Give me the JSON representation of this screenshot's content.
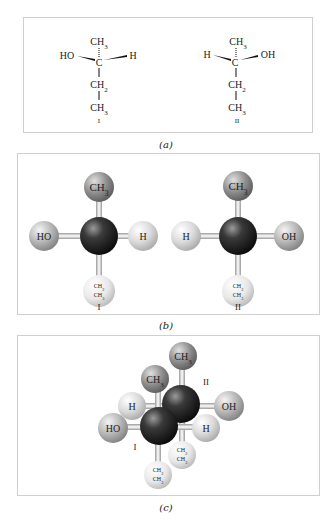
{
  "figure": {
    "panels": [
      {
        "id": "a",
        "caption": "(a)",
        "type": "wedge-dash structural formulas",
        "molecules": [
          {
            "label": "I",
            "top": "CH3",
            "center": "C",
            "left": "HO",
            "right": "H",
            "chain": [
              "CH2",
              "CH3"
            ]
          },
          {
            "label": "II",
            "top": "CH3",
            "center": "C",
            "left": "H",
            "right": "OH",
            "chain": [
              "CH2",
              "CH3"
            ]
          }
        ]
      },
      {
        "id": "b",
        "caption": "(b)",
        "type": "ball-and-stick models",
        "molecules": [
          {
            "label": "I",
            "top": "CH3",
            "left": "HO",
            "right": "H",
            "bottom_line1": "CH2",
            "bottom_line2": "CH3"
          },
          {
            "label": "II",
            "top": "CH3",
            "left": "H",
            "right": "OH",
            "bottom_line1": "CH2",
            "bottom_line2": "CH3"
          }
        ]
      },
      {
        "id": "c",
        "caption": "(c)",
        "type": "superimposed ball-and-stick models",
        "labels": {
          "molecule_I": "I",
          "molecule_II": "II",
          "back_top": "CH3",
          "front_top": "CH3",
          "back_left": "H",
          "back_right": "OH",
          "front_left": "HO",
          "front_right": "H",
          "back_bottom_line1": "CH2",
          "back_bottom_line2": "CH3",
          "front_bottom_line1": "CH2",
          "front_bottom_line2": "CH3"
        }
      }
    ],
    "subscripts": {
      "two": "2",
      "three": "3"
    },
    "colors": {
      "carbon": "#1e1e1e",
      "methyl": "#8a8a8a",
      "hydroxyl": "#b8b8b8",
      "hydrogen": "#d9d9d9",
      "ethyl": "#e6e6e6",
      "border": "#cfcfcf"
    }
  }
}
